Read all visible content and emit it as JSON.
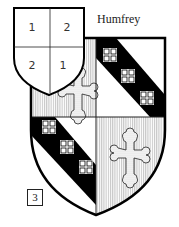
{
  "title": "Humfrey",
  "figure_number": "3",
  "key_shield": {
    "quarters": [
      "1",
      "2",
      "2",
      "1"
    ]
  },
  "main_shield": {
    "quarters": [
      {
        "position": "dexter-chief",
        "charge": "cross-botonny",
        "field": "vertical-lines"
      },
      {
        "position": "sinister-chief",
        "charge": "bend-with-three-cross-crosslets",
        "field": "white"
      },
      {
        "position": "dexter-base",
        "charge": "bend-with-three-cross-crosslets",
        "field": "white"
      },
      {
        "position": "sinister-base",
        "charge": "cross-botonny",
        "field": "vertical-lines"
      }
    ]
  }
}
